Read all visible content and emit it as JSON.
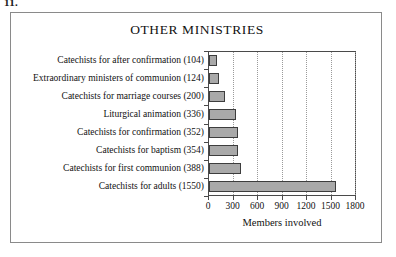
{
  "figure": {
    "caption": "11."
  },
  "chart_data": {
    "type": "bar",
    "orientation": "horizontal",
    "title": "OTHER MINISTRIES",
    "xlabel": "Members involved",
    "ylabel": "",
    "xlim": [
      0,
      1800
    ],
    "xticks": [
      0,
      300,
      600,
      900,
      1200,
      1500,
      1800
    ],
    "xtick_labels": [
      "0",
      "300",
      "600",
      "900",
      "1200",
      "1500",
      "1800"
    ],
    "grid": "vertical-dotted",
    "legend": "none",
    "bar_color": "#a9a9a9",
    "bar_edge_color": "#3d3d3d",
    "categories": [
      "Catechists for after confirmation (104)",
      "Extraordinary ministers of communion (124)",
      "Catechists for marriage courses (200)",
      "Liturgical animation (336)",
      "Catechists for confirmation (352)",
      "Catechists for baptism (354)",
      "Catechists for first communion (388)",
      "Catechists for adults (1550)"
    ],
    "values": [
      104,
      124,
      200,
      336,
      352,
      354,
      388,
      1550
    ]
  }
}
